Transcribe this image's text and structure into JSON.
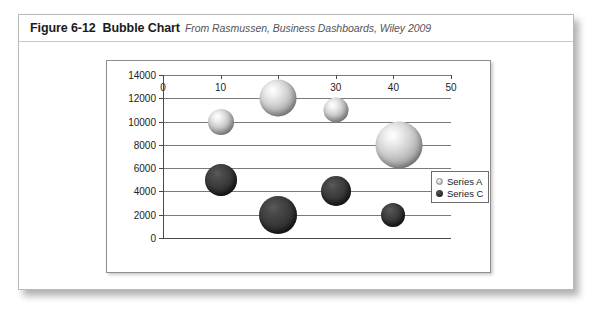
{
  "caption": {
    "figure_number": "Figure 6-12",
    "title": "Bubble Chart",
    "source": "From Rasmussen, Business Dashboards, Wiley 2009"
  },
  "legend": {
    "position": "right",
    "entries": [
      {
        "label": "Series A",
        "marker": "light-bubble-marker"
      },
      {
        "label": "Series C",
        "marker": "dark-bubble-marker"
      }
    ]
  },
  "chart_data": {
    "type": "scatter",
    "title": "Bubble Chart",
    "xlabel": "",
    "ylabel": "",
    "xlim": [
      0,
      50
    ],
    "ylim": [
      0,
      14000
    ],
    "xticks": [
      0,
      10,
      20,
      30,
      40,
      50
    ],
    "yticks": [
      0,
      2000,
      4000,
      6000,
      8000,
      10000,
      12000,
      14000
    ],
    "xtick_labels": [
      "0",
      "10",
      "20",
      "30",
      "40",
      "50"
    ],
    "ytick_labels": [
      "0",
      "2000",
      "4000",
      "6000",
      "8000",
      "10000",
      "12000",
      "14000"
    ],
    "grid": "horizontal",
    "legend_position": "right",
    "series": [
      {
        "name": "Series A",
        "color": "#c9c9c9",
        "points": [
          {
            "x": 10,
            "y": 10000,
            "size": 26
          },
          {
            "x": 20,
            "y": 12000,
            "size": 37
          },
          {
            "x": 30,
            "y": 11000,
            "size": 25
          },
          {
            "x": 41,
            "y": 8000,
            "size": 47
          }
        ]
      },
      {
        "name": "Series C",
        "color": "#2e2e2e",
        "points": [
          {
            "x": 10,
            "y": 5000,
            "size": 32
          },
          {
            "x": 20,
            "y": 2000,
            "size": 38
          },
          {
            "x": 30,
            "y": 4000,
            "size": 30
          },
          {
            "x": 40,
            "y": 2000,
            "size": 24
          }
        ]
      }
    ]
  }
}
